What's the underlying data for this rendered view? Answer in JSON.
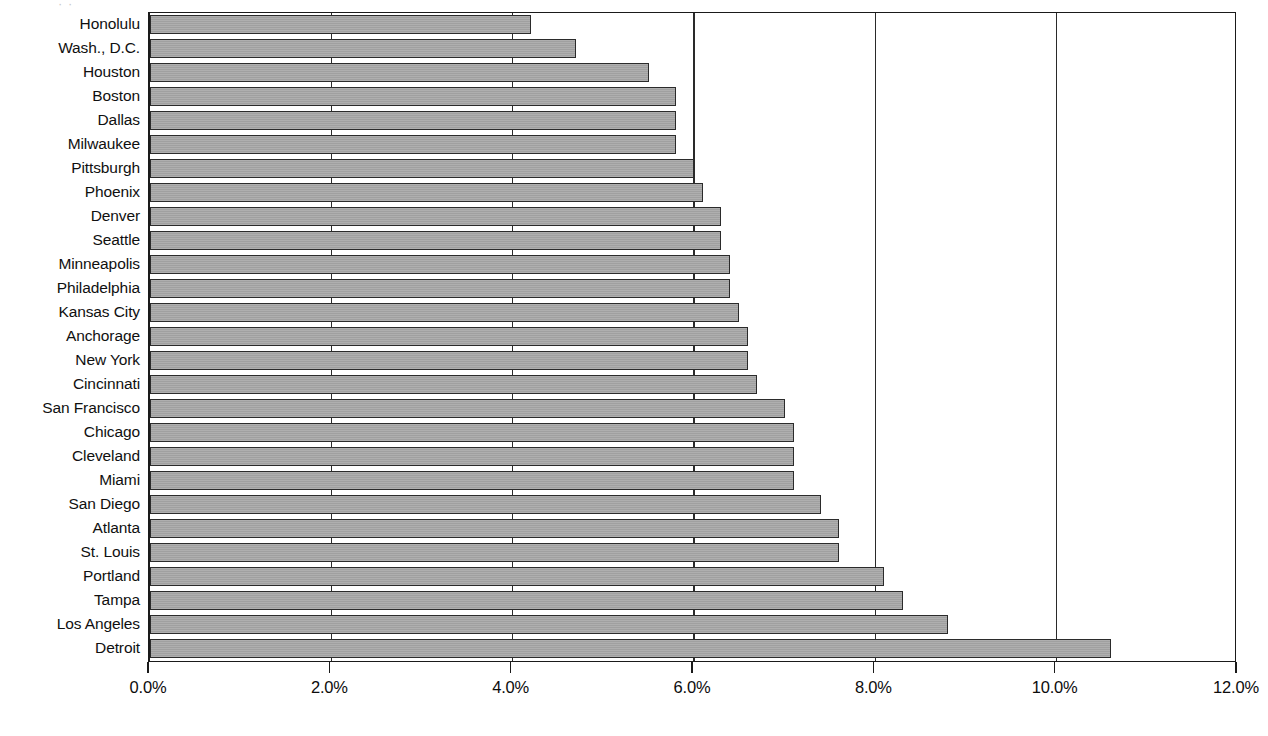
{
  "chart_data": {
    "type": "bar",
    "orientation": "horizontal",
    "title": "",
    "subtitle": "",
    "xlabel": "",
    "ylabel": "",
    "xlim": [
      0,
      12
    ],
    "xtick_labels": [
      "0.0%",
      "2.0%",
      "4.0%",
      "6.0%",
      "8.0%",
      "10.0%",
      "12.0%"
    ],
    "xticks": [
      0,
      2,
      4,
      6,
      8,
      10,
      12
    ],
    "grid": "vertical-gridlines-at-xticks",
    "legend": "none",
    "unit": "%",
    "categories": [
      "Honolulu",
      "Wash., D.C.",
      "Houston",
      "Boston",
      "Dallas",
      "Milwaukee",
      "Pittsburgh",
      "Phoenix",
      "Denver",
      "Seattle",
      "Minneapolis",
      "Philadelphia",
      "Kansas City",
      "Anchorage",
      "New York",
      "Cincinnati",
      "San Francisco",
      "Chicago",
      "Cleveland",
      "Miami",
      "San Diego",
      "Atlanta",
      "St. Louis",
      "Portland",
      "Tampa",
      "Los Angeles",
      "Detroit"
    ],
    "values": [
      4.2,
      4.7,
      5.5,
      5.8,
      5.8,
      5.8,
      6.0,
      6.1,
      6.3,
      6.3,
      6.4,
      6.4,
      6.5,
      6.6,
      6.6,
      6.7,
      7.0,
      7.1,
      7.1,
      7.1,
      7.4,
      7.6,
      7.6,
      8.1,
      8.3,
      8.8,
      10.6
    ]
  },
  "style": {
    "bar_fill": "#a6a6a6",
    "bar_border": "#2b2b2b",
    "axis_color": "#1a1a1a",
    "background": "#ffffff",
    "text_color": "#101010"
  },
  "title_remnant": "·   ·"
}
